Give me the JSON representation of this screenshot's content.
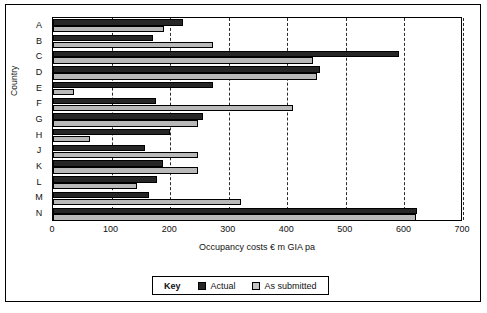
{
  "chart_data": {
    "type": "bar",
    "orientation": "horizontal",
    "title": "",
    "xlabel": "Occupancy costs € m GIA pa",
    "ylabel": "Country",
    "categories": [
      "A",
      "B",
      "C",
      "D",
      "E",
      "F",
      "G",
      "H",
      "J",
      "K",
      "L",
      "M",
      "N"
    ],
    "series": [
      {
        "name": "Actual",
        "color": "#262626",
        "values": [
          222,
          171,
          590,
          455,
          273,
          176,
          256,
          199,
          157,
          188,
          178,
          164,
          622
        ]
      },
      {
        "name": "As submitted",
        "color": "#b9b9b9",
        "values": [
          190,
          273,
          444,
          450,
          35,
          410,
          247,
          64,
          247,
          247,
          143,
          321,
          620
        ]
      }
    ],
    "xlim": [
      0,
      700
    ],
    "xticks": [
      0,
      100,
      200,
      300,
      400,
      500,
      600,
      700
    ],
    "xtick_labels": [
      "0",
      "100",
      "200",
      "300",
      "400",
      "500",
      "600",
      "700"
    ],
    "grid": "vertical-dashed",
    "legend_position": "bottom-center"
  },
  "legend": {
    "key_label": "Key",
    "entries": [
      {
        "label": "Actual",
        "swatch": "actual-swatch"
      },
      {
        "label": "As submitted",
        "swatch": "as-submitted-swatch"
      }
    ]
  }
}
